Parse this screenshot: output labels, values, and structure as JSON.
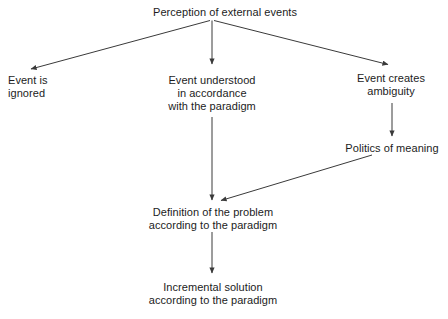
{
  "diagram": {
    "type": "flowchart",
    "title": "Perception of external events",
    "background_color": "#ffffff",
    "line_color": "#3a3a3a",
    "text_color": "#1c1c1c",
    "nodes": {
      "perception": {
        "id": "perception",
        "lines": [
          "Perception of external events"
        ],
        "line1": "Perception of external events"
      },
      "ignored": {
        "id": "ignored",
        "lines": [
          "Event is",
          "ignored"
        ],
        "line1": "Event is",
        "line2": "ignored"
      },
      "understood": {
        "id": "understood",
        "lines": [
          "Event understood",
          "in accordance",
          "with the paradigm"
        ],
        "line1": "Event understood",
        "line2": "in accordance",
        "line3": "with the paradigm"
      },
      "ambiguity": {
        "id": "ambiguity",
        "lines": [
          "Event creates",
          "ambiguity"
        ],
        "line1": "Event creates",
        "line2": "ambiguity"
      },
      "politics": {
        "id": "politics",
        "lines": [
          "Politics of meaning"
        ],
        "line1": "Politics of meaning"
      },
      "definition": {
        "id": "definition",
        "lines": [
          "Definition of the problem",
          "according to the paradigm"
        ],
        "line1": "Definition of the problem",
        "line2": "according to the paradigm"
      },
      "incremental": {
        "id": "incremental",
        "lines": [
          "Incremental solution",
          "according to the paradigm"
        ],
        "line1": "Incremental solution",
        "line2": "according to the paradigm"
      }
    },
    "edges": [
      {
        "id": "perception-to-ignored",
        "from": "perception",
        "to": "ignored",
        "style": "diagonal-left"
      },
      {
        "id": "perception-to-understood",
        "from": "perception",
        "to": "understood",
        "style": "vertical"
      },
      {
        "id": "perception-to-ambiguity",
        "from": "perception",
        "to": "ambiguity",
        "style": "diagonal-right"
      },
      {
        "id": "ambiguity-to-politics",
        "from": "ambiguity",
        "to": "politics",
        "style": "vertical"
      },
      {
        "id": "understood-to-definition",
        "from": "understood",
        "to": "definition",
        "style": "vertical"
      },
      {
        "id": "politics-to-definition",
        "from": "politics",
        "to": "definition",
        "style": "diagonal-left"
      },
      {
        "id": "definition-to-incremental",
        "from": "definition",
        "to": "incremental",
        "style": "vertical"
      }
    ]
  }
}
